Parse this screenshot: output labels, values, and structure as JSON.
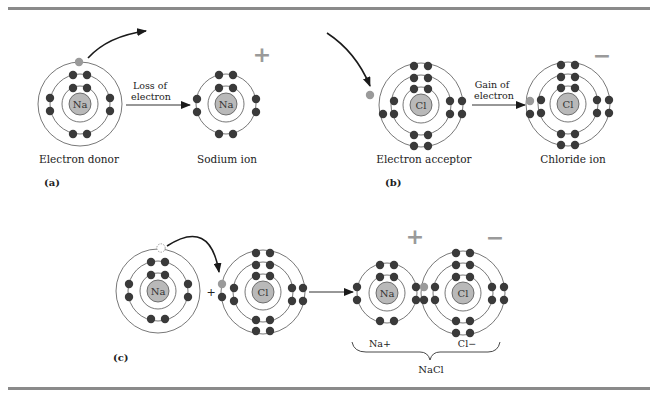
{
  "figure": {
    "colors": {
      "rule": "#8a8a8a",
      "shell": "#555555",
      "electron": "#3a3a3a",
      "transferred_electron": "#9a9a9a",
      "nucleus_fill": "#b9b9b9",
      "charge_sign": "#9a9a9a",
      "arrow": "#1a1a1a"
    },
    "panel_a": {
      "panel_label": "(a)",
      "donor": {
        "nucleus": "Na",
        "caption": "Electron donor",
        "shells": [
          2,
          8,
          1
        ]
      },
      "transition_label_line1": "Loss of",
      "transition_label_line2": "electron",
      "ion": {
        "nucleus": "Na",
        "caption": "Sodium ion",
        "charge": "+",
        "shells": [
          2,
          8
        ]
      }
    },
    "panel_b": {
      "panel_label": "(b)",
      "acceptor": {
        "nucleus": "Cl",
        "caption": "Electron acceptor",
        "shells": [
          2,
          8,
          7
        ]
      },
      "transition_label_line1": "Gain of",
      "transition_label_line2": "electron",
      "ion": {
        "nucleus": "Cl",
        "caption": "Chloride ion",
        "charge": "−",
        "shells": [
          2,
          8,
          8
        ]
      }
    },
    "panel_c": {
      "panel_label": "(c)",
      "reactant_1": {
        "nucleus": "Na"
      },
      "plus": "+",
      "reactant_2": {
        "nucleus": "Cl"
      },
      "product_cation": {
        "nucleus": "Na",
        "label": "Na+",
        "charge": "+"
      },
      "product_anion": {
        "nucleus": "Cl",
        "label": "Cl−",
        "charge": "−"
      },
      "compound_label": "NaCl"
    }
  }
}
